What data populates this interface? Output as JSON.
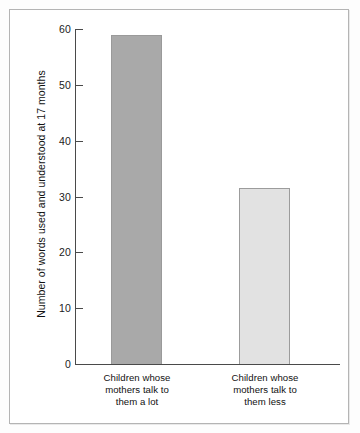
{
  "chart_data": {
    "type": "bar",
    "title": "",
    "subtitle": "",
    "xlabel": "",
    "ylabel": "Number of words used and understood at 17 months",
    "categories": [
      "Children whose mothers talk to them a lot",
      "Children whose mothers talk to them less"
    ],
    "category_lines": [
      [
        "Children whose",
        "mothers talk to",
        "them a lot"
      ],
      [
        "Children whose",
        "mothers talk to",
        "them less"
      ]
    ],
    "values": [
      59,
      31.5
    ],
    "ylim": [
      0,
      60
    ],
    "yticks": [
      0,
      10,
      20,
      30,
      40,
      50,
      60
    ],
    "ytick_labels": [
      "0",
      "10",
      "20",
      "30",
      "40",
      "50",
      "60"
    ],
    "grid": false,
    "legend": null,
    "bar_colors": [
      "#a9a9a9",
      "#e2e2e2"
    ],
    "bar_border_color": "#9a9a9a",
    "axis_color": "#4a4a4a",
    "frame_color": "#b4b4b4",
    "background": "#ffffff"
  }
}
